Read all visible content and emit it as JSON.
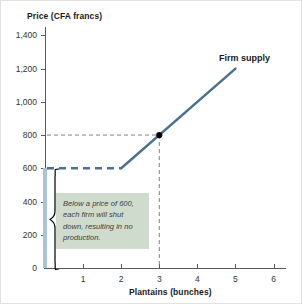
{
  "chart_data": {
    "type": "line",
    "title": "",
    "ylabel": "Price (CFA francs)",
    "xlabel": "Plantains (bunches)",
    "xlim": [
      0,
      6.3
    ],
    "ylim": [
      0,
      1450
    ],
    "grid": false,
    "legend_position": "inline-label",
    "x_ticks": [
      "1",
      "2",
      "3",
      "4",
      "5",
      "6"
    ],
    "x_tick_values": [
      1,
      2,
      3,
      4,
      5,
      6
    ],
    "y_ticks": [
      "0",
      "200",
      "400",
      "600",
      "800",
      "1,000",
      "1,200",
      "1,400"
    ],
    "y_tick_values": [
      0,
      200,
      400,
      600,
      800,
      1000,
      1200,
      1400
    ],
    "series": [
      {
        "name": "Firm supply",
        "color": "#4a7191",
        "style": "solid",
        "points": [
          [
            2,
            600
          ],
          [
            5,
            1200
          ]
        ]
      },
      {
        "name": "Shutdown segment",
        "color": "#a9c4d4",
        "style": "solid-thick-vertical",
        "points": [
          [
            0,
            0
          ],
          [
            0,
            600
          ]
        ]
      },
      {
        "name": "Price floor guide at 600",
        "color": "#4a7191",
        "style": "dashed",
        "points": [
          [
            0,
            600
          ],
          [
            2,
            600
          ]
        ]
      },
      {
        "name": "Guide to point at 800",
        "color": "#808080",
        "style": "dashed",
        "points": [
          [
            0,
            800
          ],
          [
            3,
            800
          ],
          [
            3,
            0
          ]
        ]
      }
    ],
    "markers": [
      {
        "x": 3,
        "y": 800,
        "color": "#000000",
        "shape": "circle"
      }
    ],
    "annotations": [
      {
        "text": "Below a price of 600, each firm will shut down, resulting in no production.",
        "box_color": "#cfdccd",
        "x_range": [
          0.3,
          2.7
        ],
        "y_range": [
          130,
          480
        ]
      },
      {
        "text": "Firm supply",
        "x": 4.6,
        "y": 1300
      }
    ]
  },
  "labels": {
    "y_axis_title": "Price (CFA francs)",
    "x_axis_title": "Plantains (bunches)",
    "supply_label": "Firm supply",
    "note": "Below a price of 600, each firm will shut down, resulting in no production."
  },
  "colors": {
    "curve": "#4a7191",
    "shutdown": "#a9c4d4",
    "note_box": "#cfdccd",
    "axis": "#58595b",
    "guide": "#808080",
    "marker": "#000000"
  }
}
